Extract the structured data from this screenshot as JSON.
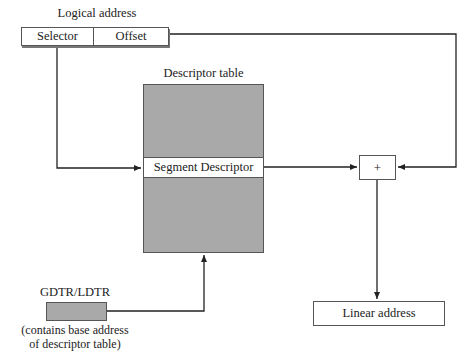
{
  "diagram": {
    "logical_address": {
      "title": "Logical address",
      "fields": [
        {
          "label": "Selector"
        },
        {
          "label": "Offset"
        }
      ]
    },
    "descriptor_table": {
      "title": "Descriptor table",
      "entry_label": "Segment Descriptor",
      "fill_color": "#a9a9a9"
    },
    "adder": {
      "symbol": "+"
    },
    "register": {
      "title": "GDTR/LDTR",
      "caption_line1": "(contains base address",
      "caption_line2": "of descriptor table)"
    },
    "output": {
      "label": "Linear address"
    }
  }
}
